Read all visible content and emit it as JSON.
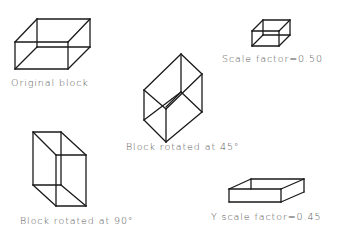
{
  "diagram": {
    "background": "#ffffff",
    "line_color": "#1a1a1a",
    "label_color": "#555555",
    "blocks": [
      {
        "id": "original",
        "label": "Original block",
        "label_pos": [
          11,
          86
        ],
        "edges": [
          [
            15,
            42,
            68,
            42
          ],
          [
            68,
            42,
            68,
            69
          ],
          [
            68,
            69,
            15,
            69
          ],
          [
            15,
            69,
            15,
            42
          ],
          [
            37,
            19,
            90,
            19
          ],
          [
            90,
            19,
            90,
            47
          ],
          [
            90,
            47,
            68,
            69
          ],
          [
            37,
            19,
            37,
            47
          ],
          [
            37,
            47,
            90,
            47
          ],
          [
            37,
            47,
            15,
            69
          ],
          [
            15,
            42,
            37,
            19
          ],
          [
            68,
            42,
            90,
            19
          ]
        ]
      },
      {
        "id": "scaled",
        "label": "Scale factor=0.50",
        "label_pos": [
          222,
          62
        ],
        "edges": [
          [
            252,
            31,
            279,
            31
          ],
          [
            279,
            31,
            279,
            46
          ],
          [
            279,
            46,
            252,
            46
          ],
          [
            252,
            46,
            252,
            31
          ],
          [
            263,
            20,
            290,
            20
          ],
          [
            290,
            20,
            290,
            35
          ],
          [
            290,
            35,
            279,
            46
          ],
          [
            263,
            20,
            263,
            35
          ],
          [
            263,
            35,
            290,
            35
          ],
          [
            263,
            35,
            252,
            46
          ],
          [
            252,
            31,
            263,
            20
          ],
          [
            279,
            31,
            290,
            20
          ]
        ]
      },
      {
        "id": "rotated45",
        "label": "Block rotated at 45°",
        "label_pos": [
          126,
          150
        ],
        "edges": [
          [
            181,
            54,
            202,
            74
          ],
          [
            202,
            74,
            166,
            109
          ],
          [
            166,
            109,
            144,
            90
          ],
          [
            144,
            90,
            181,
            54
          ],
          [
            181,
            54,
            181,
            92
          ],
          [
            181,
            92,
            202,
            112
          ],
          [
            202,
            112,
            166,
            142
          ],
          [
            166,
            142,
            144,
            120
          ],
          [
            144,
            120,
            144,
            90
          ],
          [
            202,
            74,
            202,
            112
          ],
          [
            166,
            109,
            166,
            142
          ],
          [
            181,
            92,
            144,
            120
          ],
          [
            181,
            92,
            166,
            107
          ]
        ]
      },
      {
        "id": "rotated90",
        "label": "Block rotated at 90°",
        "label_pos": [
          20,
          224
        ],
        "edges": [
          [
            33,
            132,
            61,
            132
          ],
          [
            61,
            132,
            86,
            155
          ],
          [
            86,
            155,
            56,
            155
          ],
          [
            56,
            155,
            33,
            132
          ],
          [
            56,
            155,
            56,
            206
          ],
          [
            56,
            206,
            86,
            206
          ],
          [
            86,
            206,
            86,
            155
          ],
          [
            33,
            132,
            33,
            185
          ],
          [
            33,
            185,
            56,
            206
          ],
          [
            61,
            132,
            61,
            185
          ],
          [
            61,
            185,
            33,
            185
          ],
          [
            61,
            185,
            86,
            206
          ]
        ]
      },
      {
        "id": "yscaled",
        "label": "Y scale factor=0.45",
        "label_pos": [
          211,
          220
        ],
        "edges": [
          [
            229,
            189,
            281,
            189
          ],
          [
            281,
            189,
            281,
            202
          ],
          [
            281,
            202,
            229,
            202
          ],
          [
            229,
            202,
            229,
            189
          ],
          [
            251,
            179,
            304,
            179
          ],
          [
            304,
            179,
            304,
            192
          ],
          [
            304,
            192,
            281,
            202
          ],
          [
            251,
            179,
            251,
            189
          ],
          [
            229,
            189,
            251,
            179
          ],
          [
            281,
            189,
            304,
            179
          ]
        ]
      }
    ]
  }
}
